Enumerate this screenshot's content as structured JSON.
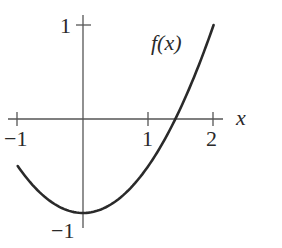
{
  "chart_data": {
    "type": "line",
    "title": "",
    "xlabel": "x",
    "ylabel": "",
    "xlim": [
      -1,
      2
    ],
    "ylim": [
      -1,
      1
    ],
    "grid": false,
    "legend": null,
    "x_ticks": [
      -1,
      1,
      2
    ],
    "x_tick_labels": [
      "−1",
      "1",
      "2"
    ],
    "y_ticks": [
      1,
      -1
    ],
    "y_tick_labels": [
      "1",
      "−1"
    ],
    "series": [
      {
        "name": "f(x)",
        "expression": "0.5*x^2 - 1",
        "x": [
          -1.0,
          -0.75,
          -0.5,
          -0.25,
          0.0,
          0.25,
          0.5,
          0.75,
          1.0,
          1.25,
          1.414,
          1.5,
          1.75,
          2.0
        ],
        "y": [
          -0.5,
          -0.72,
          -0.875,
          -0.97,
          -1.0,
          -0.97,
          -0.875,
          -0.72,
          -0.5,
          -0.22,
          0.0,
          0.125,
          0.53,
          1.0
        ],
        "color": "#2a2a2a"
      }
    ],
    "annotations": [
      {
        "text": "f(x)",
        "x": 1.5,
        "y": 0.75
      }
    ]
  },
  "labels": {
    "x_axis": "x",
    "curve": "f(x)",
    "x_tick_neg1": "−1",
    "x_tick_1": "1",
    "x_tick_2": "2",
    "y_tick_1": "1",
    "y_tick_neg1": "−1"
  },
  "colors": {
    "axis": "#555555",
    "curve": "#2a2a2a",
    "text": "#2a2a2a",
    "background": "#ffffff"
  }
}
